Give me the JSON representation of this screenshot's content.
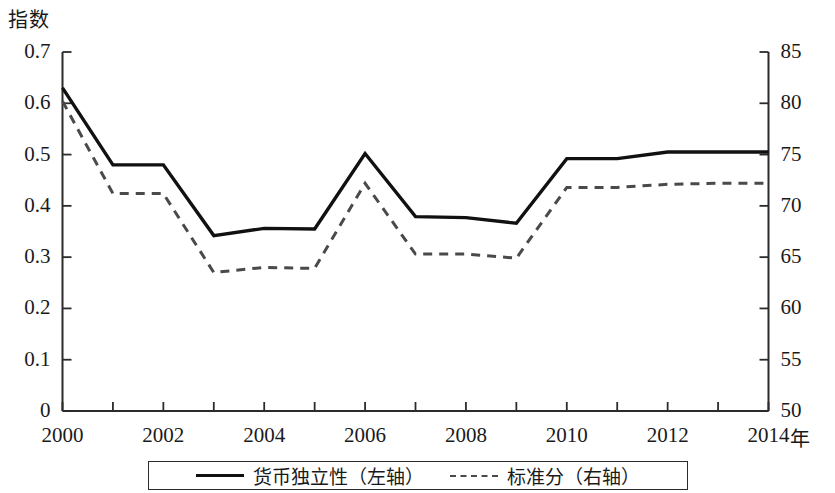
{
  "chart_data": {
    "type": "line",
    "title": "",
    "xlabel": "年",
    "ylabel": "指数",
    "ylabel_right": "",
    "x": [
      2000,
      2001,
      2002,
      2003,
      2004,
      2005,
      2006,
      2007,
      2008,
      2009,
      2010,
      2011,
      2012,
      2013,
      2014
    ],
    "xtick_labels": [
      "2000",
      "2002",
      "2004",
      "2006",
      "2008",
      "2010",
      "2012",
      "2014"
    ],
    "xtick_values": [
      2000,
      2002,
      2004,
      2006,
      2008,
      2010,
      2012,
      2014
    ],
    "xlim": [
      2000,
      2014
    ],
    "ylim": [
      0,
      0.7
    ],
    "ytick_labels": [
      "0",
      "0.1",
      "0.2",
      "0.3",
      "0.4",
      "0.5",
      "0.6",
      "0.7"
    ],
    "ytick_values": [
      0,
      0.1,
      0.2,
      0.3,
      0.4,
      0.5,
      0.6,
      0.7
    ],
    "ylim_right": [
      50,
      85
    ],
    "ytick_labels_right": [
      "50",
      "55",
      "60",
      "65",
      "70",
      "75",
      "80",
      "85"
    ],
    "ytick_values_right": [
      50,
      55,
      60,
      65,
      70,
      75,
      80,
      85
    ],
    "grid": false,
    "legend_position": "bottom",
    "series": [
      {
        "name": "货币独立性（左轴）",
        "axis": "left",
        "style": "solid",
        "color": "#111111",
        "values": [
          0.63,
          0.48,
          0.48,
          0.342,
          0.356,
          0.355,
          0.502,
          0.379,
          0.377,
          0.366,
          0.492,
          0.492,
          0.505,
          0.505,
          0.505
        ]
      },
      {
        "name": "标准分（右轴）",
        "axis": "right",
        "style": "dashed",
        "color": "#4a4a4a",
        "values": [
          80.2,
          71.2,
          71.2,
          63.5,
          64.0,
          63.9,
          72.2,
          65.3,
          65.3,
          64.9,
          71.8,
          71.8,
          72.1,
          72.2,
          72.2
        ]
      }
    ]
  },
  "axis_titles": {
    "y_left": "指数",
    "x": "年"
  },
  "legend": {
    "items": [
      {
        "label": "货币独立性（左轴）",
        "style": "solid"
      },
      {
        "label": "标准分（右轴）",
        "style": "dashed"
      }
    ]
  }
}
